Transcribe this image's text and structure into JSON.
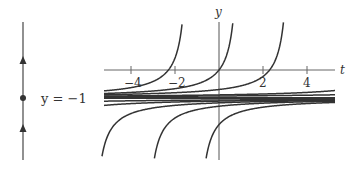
{
  "phase_line": {
    "equilibrium_label": "y = −1",
    "arrows": [
      "up",
      "up"
    ],
    "equilibrium_marker": "dot"
  },
  "axes": {
    "x_label": "t",
    "y_label": "y",
    "x_ticks": [
      "−4",
      "−2",
      "2",
      "4"
    ]
  },
  "curves": {
    "equation_family": "y = -1 - 1/(t - c)",
    "equilibrium": -1,
    "upper_branch_c": [
      -1.3,
      1.0,
      3.3
    ],
    "lower_branch_c": [
      -5.8,
      -3.4,
      -1.05
    ],
    "near_asymptote_c_above": [
      9,
      14
    ],
    "near_asymptote_c_below": [
      -9,
      -14
    ]
  },
  "colors": {
    "ink": "#333333",
    "axis": "#555555"
  }
}
